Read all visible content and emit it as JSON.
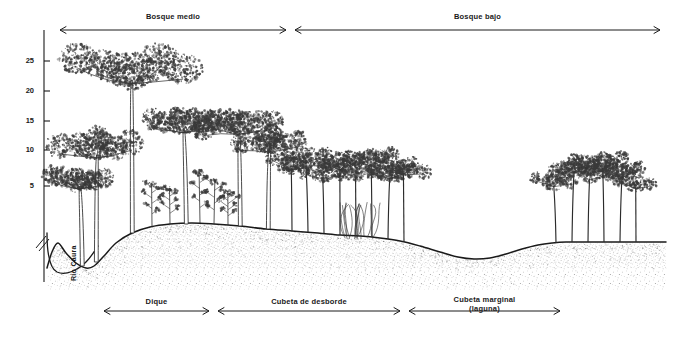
{
  "figure": {
    "background_color": "#ffffff",
    "ink_color": "#1a1a1a"
  },
  "y_axis": {
    "unit_implied": "m",
    "ticks": [
      {
        "value": "5",
        "y": 186
      },
      {
        "value": "10",
        "y": 150
      },
      {
        "value": "15",
        "y": 121
      },
      {
        "value": "20",
        "y": 91
      },
      {
        "value": "25",
        "y": 61
      }
    ],
    "axis_x": 44,
    "axis_top_y": 30,
    "axis_bottom_y": 282,
    "break_mark": "//"
  },
  "top_zones": [
    {
      "name": "bosque-medio",
      "label": "Bosque medio",
      "x1": 60,
      "x2": 286,
      "y": 30,
      "label_y": 13
    },
    {
      "name": "bosque-bajo",
      "label": "Bosque bajo",
      "x1": 295,
      "x2": 660,
      "y": 30,
      "label_y": 13
    }
  ],
  "bottom_zones": [
    {
      "name": "dique",
      "label": "Dique",
      "sublabel": "",
      "x1": 104,
      "x2": 209,
      "y": 311,
      "label_y": 298
    },
    {
      "name": "cubeta-de-desborde",
      "label": "Cubeta de desborde",
      "sublabel": "",
      "x1": 218,
      "x2": 400,
      "y": 311,
      "label_y": 298
    },
    {
      "name": "cubeta-marginal",
      "label": "Cubeta marginal",
      "sublabel": "(laguna)",
      "x1": 409,
      "x2": 560,
      "y": 311,
      "label_y": 296
    }
  ],
  "river": {
    "label": "Río Caura",
    "label_x": 70,
    "label_y": 281
  },
  "chart_data": {
    "type": "line",
    "ylabel": "Altura (m)",
    "ylim": [
      0,
      28
    ],
    "ground_profile_points": "47,268 52,252 58,243 66,253 76,263 86,268 94,266 104,256 116,243 132,233 150,227 170,224 192,223 214,224 240,226 266,229 292,231 318,233 340,235 360,236 380,238 400,241 420,246 440,252 458,257 474,259 490,258 506,254 522,249 538,245 552,243 566,242 590,242 620,242 648,242 666,242"
  },
  "trees": {
    "canopy_color": "#3a3a3a",
    "trunk_color": "#2b2b2b",
    "bosque_medio_tall": [
      {
        "x": 132,
        "ground": 233,
        "height": 178,
        "crown_w": 118,
        "crown_h": 36
      },
      {
        "x": 96,
        "ground": 262,
        "height": 128,
        "crown_w": 76,
        "crown_h": 30
      },
      {
        "x": 82,
        "ground": 266,
        "height": 96,
        "crown_w": 58,
        "crown_h": 24
      },
      {
        "x": 186,
        "ground": 224,
        "height": 112,
        "crown_w": 62,
        "crown_h": 26
      },
      {
        "x": 240,
        "ground": 226,
        "height": 114,
        "crown_w": 72,
        "crown_h": 28
      },
      {
        "x": 268,
        "ground": 229,
        "height": 96,
        "crown_w": 58,
        "crown_h": 24
      }
    ],
    "bosque_medio_small": [
      {
        "x": 152,
        "ground": 227,
        "height": 44
      },
      {
        "x": 170,
        "ground": 224,
        "height": 36
      },
      {
        "x": 200,
        "ground": 223,
        "height": 52
      },
      {
        "x": 214,
        "ground": 224,
        "height": 44
      },
      {
        "x": 228,
        "ground": 225,
        "height": 34
      }
    ],
    "bosque_bajo": [
      {
        "x": 292,
        "ground": 231,
        "height": 74,
        "crown_w": 44,
        "crown_h": 20
      },
      {
        "x": 308,
        "ground": 232,
        "height": 82,
        "crown_w": 46,
        "crown_h": 20
      },
      {
        "x": 324,
        "ground": 233,
        "height": 66,
        "crown_w": 40,
        "crown_h": 18
      },
      {
        "x": 340,
        "ground": 235,
        "height": 78,
        "crown_w": 44,
        "crown_h": 20
      },
      {
        "x": 356,
        "ground": 236,
        "height": 70,
        "crown_w": 42,
        "crown_h": 18
      },
      {
        "x": 372,
        "ground": 237,
        "height": 84,
        "crown_w": 48,
        "crown_h": 20
      },
      {
        "x": 388,
        "ground": 239,
        "height": 72,
        "crown_w": 44,
        "crown_h": 18
      },
      {
        "x": 404,
        "ground": 242,
        "height": 80,
        "crown_w": 46,
        "crown_h": 20
      }
    ],
    "right_cluster": [
      {
        "x": 556,
        "ground": 243,
        "height": 68,
        "crown_w": 40,
        "crown_h": 18
      },
      {
        "x": 572,
        "ground": 242,
        "height": 82,
        "crown_w": 46,
        "crown_h": 20
      },
      {
        "x": 588,
        "ground": 242,
        "height": 74,
        "crown_w": 42,
        "crown_h": 18
      },
      {
        "x": 604,
        "ground": 242,
        "height": 86,
        "crown_w": 48,
        "crown_h": 20
      },
      {
        "x": 620,
        "ground": 242,
        "height": 76,
        "crown_w": 44,
        "crown_h": 18
      },
      {
        "x": 636,
        "ground": 242,
        "height": 64,
        "crown_w": 38,
        "crown_h": 16
      }
    ]
  }
}
